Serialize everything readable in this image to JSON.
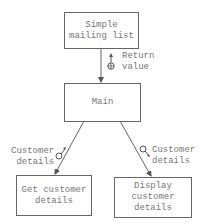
{
  "diagram": {
    "type": "structure-chart",
    "modules": [
      {
        "id": "simple_mailing_list",
        "label": "Simple\nmailing list"
      },
      {
        "id": "main",
        "label": "Main"
      },
      {
        "id": "get_customer_details",
        "label": "Get customer\ndetails"
      },
      {
        "id": "display_customer_details",
        "label": "Display\ncustomer\ndetails"
      }
    ],
    "connections": [
      {
        "from": "simple_mailing_list",
        "to": "main",
        "couple": {
          "label": "Return\nvalue",
          "icon": "data-couple-up-arrow-icon",
          "direction": "up"
        }
      },
      {
        "from": "main",
        "to": "get_customer_details",
        "couple": {
          "label": "Customer\ndetails",
          "icon": "data-couple-up-arrow-icon",
          "direction": "up"
        }
      },
      {
        "from": "main",
        "to": "display_customer_details",
        "couple": {
          "label": "Customer\ndetails",
          "icon": "data-couple-down-arrow-icon",
          "direction": "down"
        }
      }
    ]
  }
}
